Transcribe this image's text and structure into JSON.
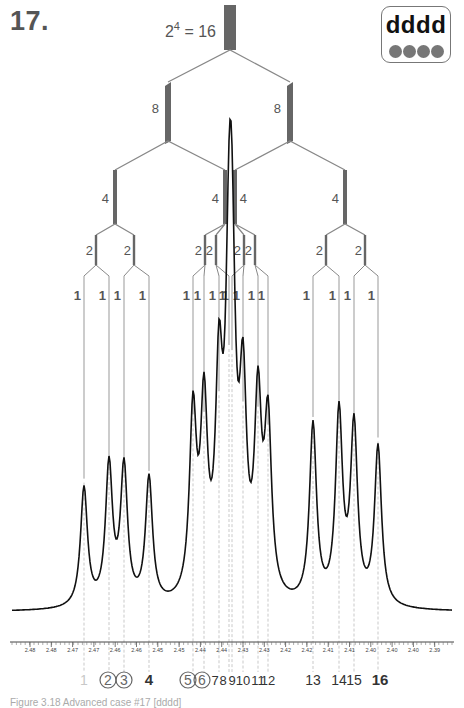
{
  "figure": {
    "number": "17.",
    "caption": "Figure 3.18 Advanced case #17 [dddd]"
  },
  "badge": {
    "text": "dddd",
    "dot_count": 4,
    "dot_color": "#777777"
  },
  "tree": {
    "root_label_base": "2",
    "root_label_exp": "4",
    "root_label_rest": " = 16",
    "bar_color": "#666666",
    "line_color": "#888888",
    "level8_labels": [
      "8",
      "8"
    ],
    "level4_labels": [
      "4",
      "4",
      "4",
      "4"
    ],
    "level2_labels": [
      "2",
      "2",
      "2",
      "2",
      "2",
      "2",
      "2",
      "2"
    ],
    "leaf_labels": [
      "1",
      "1",
      "1",
      "1",
      "1",
      "1",
      "1",
      "1",
      "1",
      "1",
      "1",
      "1",
      "1",
      "1",
      "1",
      "1"
    ]
  },
  "chart_data": {
    "type": "line",
    "xlabel": "chemical shift (ppm)",
    "ylabel": "",
    "x_reversed": true,
    "tick_labels": [
      "2.48",
      "2.48",
      "2.47",
      "2.47",
      "2.46",
      "2.46",
      "2.45",
      "2.45",
      "2.44",
      "2.44",
      "2.43",
      "2.43",
      "2.42",
      "2.42",
      "2.41",
      "2.41",
      "2.40",
      "2.40",
      "2.40",
      "2.39"
    ],
    "peaks": [
      {
        "line": 1,
        "height": 0.48
      },
      {
        "line": 2,
        "height": 0.56
      },
      {
        "line": 3,
        "height": 0.55
      },
      {
        "line": 4,
        "height": 0.51
      },
      {
        "line": 5,
        "height": 0.73
      },
      {
        "line": 6,
        "height": 0.74
      },
      {
        "line": 7,
        "height": 0.82
      },
      {
        "line": 8,
        "height": 1.0
      },
      {
        "line": 9,
        "height": 0.98
      },
      {
        "line": 10,
        "height": 0.78
      },
      {
        "line": 11,
        "height": 0.76
      },
      {
        "line": 12,
        "height": 0.69
      },
      {
        "line": 13,
        "height": 0.72
      },
      {
        "line": 14,
        "height": 0.76
      },
      {
        "line": 15,
        "height": 0.71
      },
      {
        "line": 16,
        "height": 0.64
      }
    ],
    "grid": false,
    "legend": "none"
  },
  "line_numbers": [
    {
      "label": "1",
      "style": "faint"
    },
    {
      "label": "2",
      "style": "circled"
    },
    {
      "label": "3",
      "style": "circled"
    },
    {
      "label": "4",
      "style": "bold"
    },
    {
      "label": "5",
      "style": "circled"
    },
    {
      "label": "6",
      "style": "circled"
    },
    {
      "label": "7",
      "style": "plain"
    },
    {
      "label": "8",
      "style": "plain"
    },
    {
      "label": "9",
      "style": "plain"
    },
    {
      "label": "10",
      "style": "plain"
    },
    {
      "label": "11",
      "style": "plain"
    },
    {
      "label": "12",
      "style": "plain"
    },
    {
      "label": "13",
      "style": "plain"
    },
    {
      "label": "14",
      "style": "plain"
    },
    {
      "label": "15",
      "style": "plain"
    },
    {
      "label": "16",
      "style": "bold"
    }
  ]
}
